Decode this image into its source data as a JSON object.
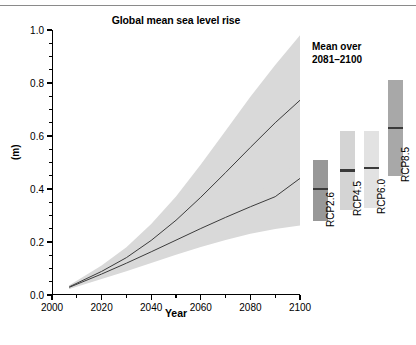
{
  "figure": {
    "title": "Global mean sea level rise",
    "legend_title_line1": "Mean over",
    "legend_title_line2": "2081–2100",
    "y_axis_label": "(m)",
    "x_axis_label": "Year"
  },
  "chart_data": {
    "type": "area",
    "title": "Global mean sea level rise",
    "xlabel": "Year",
    "ylabel": "(m)",
    "xlim": [
      2000,
      2100
    ],
    "ylim": [
      0.0,
      1.0
    ],
    "xticks": [
      2000,
      2020,
      2040,
      2060,
      2080,
      2100
    ],
    "xtick_labels": [
      "2000",
      "2020",
      "2040",
      "2060",
      "2080",
      "2100"
    ],
    "yticks": [
      0.0,
      0.2,
      0.4,
      0.6,
      0.8,
      1.0
    ],
    "ytick_labels": [
      "0.0",
      "0.2",
      "0.4",
      "0.6",
      "0.8",
      "1.0"
    ],
    "grid": false,
    "legend_position": "right-outside",
    "x": [
      2007,
      2020,
      2030,
      2040,
      2050,
      2060,
      2070,
      2080,
      2090,
      2100
    ],
    "series": [
      {
        "name": "RCP8.5 likely range",
        "shade": "light",
        "color": "#d9d9d9",
        "lower": [
          0.025,
          0.068,
          0.105,
          0.147,
          0.194,
          0.246,
          0.304,
          0.366,
          0.434,
          0.505
        ],
        "upper": [
          0.037,
          0.111,
          0.18,
          0.268,
          0.372,
          0.492,
          0.62,
          0.748,
          0.868,
          0.98
        ]
      },
      {
        "name": "RCP2.6 likely range",
        "shade": "light",
        "color": "#d9d9d9",
        "lower": [
          0.023,
          0.06,
          0.09,
          0.121,
          0.152,
          0.181,
          0.208,
          0.231,
          0.249,
          0.262
        ],
        "upper": [
          0.035,
          0.098,
          0.15,
          0.206,
          0.263,
          0.321,
          0.379,
          0.434,
          0.486,
          0.535
        ]
      },
      {
        "name": "RCP2.6 / RCP8.5 overlap",
        "shade": "dark",
        "color": "#555555",
        "lower": [
          0.025,
          0.068,
          0.105,
          0.147,
          0.194,
          0.241,
          0.268,
          0.292,
          0.313,
          0.331
        ],
        "upper": [
          0.035,
          0.098,
          0.15,
          0.206,
          0.263,
          0.321,
          0.379,
          0.434,
          0.486,
          0.535
        ]
      },
      {
        "name": "RCP8.5 median",
        "shade": "line",
        "color": "#3c3c3c",
        "values": [
          0.031,
          0.089,
          0.141,
          0.206,
          0.282,
          0.369,
          0.462,
          0.557,
          0.65,
          0.735
        ]
      },
      {
        "name": "RCP2.6 median",
        "shade": "line",
        "color": "#3c3c3c",
        "values": [
          0.029,
          0.079,
          0.12,
          0.163,
          0.207,
          0.251,
          0.293,
          0.333,
          0.371,
          0.44
        ]
      }
    ],
    "bars": [
      {
        "label": "RCP2.6",
        "low": 0.28,
        "high": 0.51,
        "median": 0.4,
        "color": "#989898"
      },
      {
        "label": "RCP4.5",
        "low": 0.32,
        "high": 0.62,
        "median": 0.47,
        "color": "#d4d4d4"
      },
      {
        "label": "RCP6.0",
        "low": 0.33,
        "high": 0.62,
        "median": 0.48,
        "color": "#e2e2e2"
      },
      {
        "label": "RCP8.5",
        "low": 0.45,
        "high": 0.81,
        "median": 0.63,
        "color": "#a8a8a8"
      }
    ]
  }
}
